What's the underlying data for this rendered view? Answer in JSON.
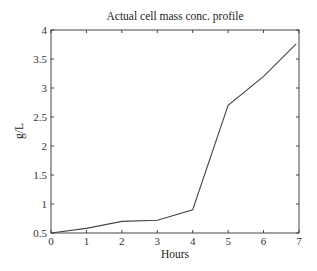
{
  "chart_data": {
    "type": "line",
    "title": "Actual cell mass conc. profile",
    "xlabel": "Hours",
    "ylabel": "g/L",
    "xlim": [
      0,
      7
    ],
    "ylim": [
      0.5,
      4
    ],
    "grid": false,
    "xticks": [
      0,
      1,
      2,
      3,
      4,
      5,
      6,
      7
    ],
    "xtick_labels": [
      "0",
      "1",
      "2",
      "3",
      "4",
      "5",
      "6",
      "7"
    ],
    "yticks": [
      0.5,
      1,
      1.5,
      2,
      2.5,
      3,
      3.5,
      4
    ],
    "ytick_labels": [
      "0.5",
      "1",
      "1.5",
      "2",
      "2.5",
      "3",
      "3.5",
      "4"
    ],
    "series": [
      {
        "name": "cell mass",
        "x": [
          0,
          1,
          2,
          3,
          4,
          5,
          6,
          6.92
        ],
        "values": [
          0.5,
          0.58,
          0.7,
          0.72,
          0.9,
          2.7,
          3.2,
          3.76
        ]
      }
    ],
    "colors": {
      "line": "#444444",
      "axis": "#444444"
    }
  }
}
